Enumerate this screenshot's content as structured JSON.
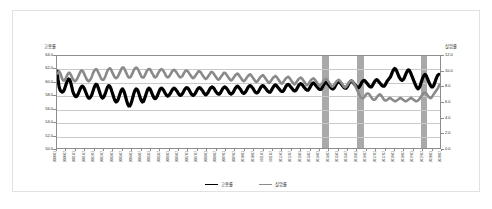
{
  "chart_data": {
    "type": "line",
    "title": "",
    "xlabel": "",
    "left_axis": {
      "title": "고용률",
      "unit": "%",
      "ylim": [
        50.0,
        64.0
      ],
      "ticks": [
        "64.0",
        "62.0",
        "60.0",
        "58.0",
        "56.0",
        "54.0",
        "52.0",
        "50.0"
      ]
    },
    "right_axis": {
      "title": "실업률",
      "unit": "%",
      "ylim": [
        0.0,
        12.0
      ],
      "ticks": [
        "12.0",
        "10.0",
        "8.0",
        "6.0",
        "4.0",
        "2.0",
        "0.0"
      ]
    },
    "grid": true,
    "legend_position": "bottom",
    "legend": [
      "고용률",
      "실업률"
    ],
    "x_tick_labels": [
      "2000.01",
      "2000.07",
      "2001.01",
      "2001.07",
      "2002.01",
      "2002.07",
      "2003.01",
      "2003.07",
      "2004.01",
      "2004.07",
      "2005.01",
      "2005.07",
      "2006.01",
      "2006.07",
      "2007.01",
      "2007.07",
      "2008.01",
      "2008.07",
      "2009.01",
      "2009.07",
      "2010.01",
      "2010.07",
      "2011.01",
      "2011.07",
      "2012.01",
      "2012.07",
      "2013.01",
      "2013.07",
      "2014.01",
      "2014.07",
      "2015.01",
      "2015.07",
      "2016.01",
      "2016.07",
      "2017.01",
      "2017.07",
      "2018.01",
      "2018.07",
      "2019.01",
      "2019.07",
      "2020.01",
      "2020.07"
    ],
    "shaded_bands": [
      {
        "label": "recession-band-1",
        "start_index": 250,
        "end_index": 256
      },
      {
        "label": "recession-band-2",
        "start_index": 283,
        "end_index": 289
      },
      {
        "label": "recession-band-3",
        "start_index": 343,
        "end_index": 349
      }
    ],
    "series": [
      {
        "name": "고용률",
        "axis": "left",
        "color": "#000000",
        "values": [
          61.9,
          60.4,
          59.3,
          58.8,
          58.6,
          58.5,
          58.6,
          58.9,
          59.4,
          59.9,
          60.3,
          60.5,
          60.4,
          60.0,
          59.3,
          58.6,
          58.2,
          57.9,
          57.8,
          57.9,
          58.2,
          58.6,
          59.0,
          59.3,
          59.4,
          59.3,
          59.0,
          58.6,
          58.2,
          57.8,
          57.6,
          57.6,
          57.8,
          58.1,
          58.6,
          59.1,
          59.5,
          59.7,
          59.6,
          59.2,
          58.7,
          58.2,
          57.8,
          57.6,
          57.7,
          58.0,
          58.4,
          58.9,
          59.3,
          59.5,
          59.4,
          59.1,
          58.6,
          58.1,
          57.6,
          57.2,
          57.0,
          57.1,
          57.4,
          57.9,
          58.4,
          58.8,
          59.0,
          58.8,
          58.4,
          57.8,
          57.2,
          56.7,
          56.4,
          56.4,
          56.7,
          57.2,
          57.8,
          58.4,
          58.8,
          59.0,
          58.9,
          58.6,
          58.1,
          57.6,
          57.2,
          57.0,
          57.1,
          57.5,
          58.0,
          58.5,
          58.9,
          59.1,
          59.0,
          58.7,
          58.3,
          57.9,
          57.6,
          57.5,
          57.6,
          57.9,
          58.3,
          58.7,
          59.0,
          59.1,
          59.0,
          58.8,
          58.5,
          58.2,
          58.0,
          57.9,
          58.0,
          58.2,
          58.5,
          58.8,
          59.0,
          59.1,
          59.0,
          58.8,
          58.6,
          58.3,
          58.1,
          58.0,
          58.1,
          58.3,
          58.6,
          58.9,
          59.1,
          59.2,
          59.1,
          58.9,
          58.6,
          58.3,
          58.1,
          58.0,
          58.1,
          58.3,
          58.6,
          58.9,
          59.1,
          59.2,
          59.1,
          58.9,
          58.7,
          58.4,
          58.2,
          58.1,
          58.2,
          58.4,
          58.7,
          59.0,
          59.2,
          59.3,
          59.2,
          59.0,
          58.7,
          58.5,
          58.3,
          58.2,
          58.2,
          58.4,
          58.7,
          59.0,
          59.2,
          59.3,
          59.2,
          59.0,
          58.8,
          58.5,
          58.3,
          58.2,
          58.3,
          58.5,
          58.8,
          59.1,
          59.3,
          59.4,
          59.3,
          59.1,
          58.9,
          58.6,
          58.4,
          58.3,
          58.4,
          58.6,
          58.9,
          59.2,
          59.4,
          59.5,
          59.4,
          59.2,
          59.0,
          58.7,
          58.5,
          58.4,
          58.4,
          58.6,
          58.9,
          59.2,
          59.4,
          59.5,
          59.4,
          59.2,
          59.0,
          58.8,
          58.6,
          58.5,
          58.5,
          58.7,
          59.0,
          59.3,
          59.5,
          59.6,
          59.5,
          59.3,
          59.1,
          58.9,
          58.7,
          58.6,
          58.6,
          58.8,
          59.1,
          59.4,
          59.6,
          59.7,
          59.6,
          59.4,
          59.2,
          59.0,
          58.8,
          58.7,
          58.7,
          58.9,
          59.2,
          59.5,
          59.7,
          59.8,
          59.7,
          59.5,
          59.3,
          59.1,
          58.9,
          58.8,
          58.8,
          59.0,
          59.3,
          59.6,
          59.8,
          59.9,
          59.8,
          59.6,
          59.4,
          59.2,
          59.0,
          58.9,
          58.9,
          59.1,
          59.4,
          59.7,
          59.9,
          60.0,
          59.9,
          59.7,
          59.5,
          59.3,
          59.1,
          59.0,
          59.0,
          59.2,
          59.5,
          59.8,
          60.0,
          60.1,
          60.0,
          59.8,
          59.6,
          59.4,
          59.2,
          59.1,
          59.1,
          59.3,
          59.6,
          59.9,
          60.1,
          60.2,
          60.1,
          59.9,
          59.7,
          59.5,
          59.3,
          59.2,
          59.2,
          59.4,
          59.7,
          60.0,
          60.2,
          60.3,
          60.2,
          60.0,
          59.8,
          59.6,
          59.4,
          59.3,
          59.3,
          59.5,
          59.8,
          60.1,
          60.3,
          60.4,
          60.3,
          60.1,
          59.9,
          59.7,
          59.5,
          59.4,
          59.4,
          59.6,
          59.9,
          60.2,
          60.4,
          60.6,
          60.8,
          61.2,
          61.6,
          61.9,
          62.1,
          62.0,
          61.7,
          61.3,
          60.9,
          60.6,
          60.4,
          60.3,
          60.4,
          60.6,
          61.0,
          61.4,
          61.7,
          61.9,
          61.8,
          61.5,
          61.1,
          60.7,
          60.3,
          59.9,
          59.5,
          59.2,
          59.0,
          59.1,
          59.4,
          59.9,
          60.4,
          60.8,
          61.1,
          61.2,
          61.0,
          60.6,
          60.2,
          59.8,
          59.5,
          59.3,
          59.3,
          59.5,
          59.9,
          60.4,
          60.8,
          61.1,
          61.2,
          61.1
        ]
      },
      {
        "name": "실업률",
        "axis": "right",
        "color": "#8a8a8a",
        "values": [
          9.6,
          9.8,
          10.0,
          9.8,
          9.4,
          9.0,
          8.8,
          8.8,
          9.0,
          9.3,
          9.6,
          9.8,
          9.8,
          9.6,
          9.3,
          9.0,
          8.8,
          8.7,
          8.8,
          9.0,
          9.3,
          9.6,
          9.9,
          10.1,
          10.1,
          9.9,
          9.6,
          9.3,
          9.0,
          8.8,
          8.7,
          8.8,
          9.0,
          9.3,
          9.7,
          10.0,
          10.2,
          10.3,
          10.2,
          9.9,
          9.6,
          9.3,
          9.0,
          8.9,
          8.9,
          9.1,
          9.4,
          9.8,
          10.1,
          10.3,
          10.4,
          10.3,
          10.0,
          9.7,
          9.4,
          9.2,
          9.1,
          9.2,
          9.4,
          9.7,
          10.0,
          10.3,
          10.5,
          10.5,
          10.3,
          10.0,
          9.7,
          9.4,
          9.2,
          9.2,
          9.3,
          9.6,
          9.9,
          10.2,
          10.4,
          10.5,
          10.4,
          10.2,
          9.9,
          9.6,
          9.3,
          9.2,
          9.2,
          9.4,
          9.7,
          10.0,
          10.2,
          10.3,
          10.3,
          10.1,
          9.8,
          9.6,
          9.3,
          9.2,
          9.3,
          9.5,
          9.8,
          10.0,
          10.2,
          10.3,
          10.2,
          10.0,
          9.8,
          9.5,
          9.3,
          9.2,
          9.3,
          9.5,
          9.7,
          10.0,
          10.1,
          10.2,
          10.1,
          9.9,
          9.7,
          9.5,
          9.3,
          9.2,
          9.3,
          9.4,
          9.7,
          9.9,
          10.1,
          10.1,
          10.0,
          9.8,
          9.6,
          9.4,
          9.2,
          9.1,
          9.2,
          9.4,
          9.6,
          9.8,
          10.0,
          10.0,
          9.9,
          9.7,
          9.5,
          9.3,
          9.1,
          9.0,
          9.1,
          9.3,
          9.5,
          9.7,
          9.9,
          9.9,
          9.8,
          9.6,
          9.4,
          9.2,
          9.0,
          8.9,
          9.0,
          9.2,
          9.4,
          9.6,
          9.8,
          9.8,
          9.7,
          9.5,
          9.3,
          9.1,
          8.9,
          8.8,
          8.9,
          9.1,
          9.3,
          9.5,
          9.6,
          9.7,
          9.6,
          9.4,
          9.2,
          9.0,
          8.8,
          8.7,
          8.8,
          9.0,
          9.2,
          9.4,
          9.5,
          9.6,
          9.5,
          9.3,
          9.1,
          8.9,
          8.7,
          8.6,
          8.7,
          8.9,
          9.1,
          9.3,
          9.4,
          9.5,
          9.4,
          9.2,
          9.0,
          8.8,
          8.6,
          8.5,
          8.6,
          8.8,
          9.0,
          9.2,
          9.3,
          9.4,
          9.3,
          9.1,
          8.9,
          8.7,
          8.5,
          8.4,
          8.5,
          8.7,
          8.9,
          9.1,
          9.2,
          9.3,
          9.2,
          9.0,
          8.8,
          8.6,
          8.4,
          8.3,
          8.4,
          8.6,
          8.8,
          9.0,
          9.1,
          9.2,
          9.1,
          8.9,
          8.7,
          8.5,
          8.3,
          8.2,
          8.3,
          8.5,
          8.7,
          8.9,
          9.0,
          9.1,
          9.0,
          8.8,
          8.6,
          8.4,
          8.2,
          8.1,
          8.2,
          8.4,
          8.6,
          8.8,
          8.9,
          9.0,
          8.9,
          8.7,
          8.5,
          8.3,
          8.1,
          8.0,
          8.1,
          8.3,
          8.5,
          8.7,
          8.8,
          8.9,
          8.8,
          8.6,
          8.4,
          8.2,
          8.0,
          7.9,
          8.0,
          8.2,
          8.4,
          8.6,
          8.7,
          8.8,
          8.7,
          8.5,
          8.3,
          8.0,
          7.7,
          7.4,
          7.1,
          6.8,
          6.6,
          6.5,
          6.5,
          6.6,
          6.8,
          7.0,
          7.1,
          7.1,
          7.0,
          6.8,
          6.6,
          6.4,
          6.3,
          6.3,
          6.4,
          6.6,
          6.8,
          6.9,
          7.0,
          6.9,
          6.7,
          6.5,
          6.3,
          6.2,
          6.2,
          6.3,
          6.4,
          6.5,
          6.5,
          6.4,
          6.3,
          6.2,
          6.1,
          6.1,
          6.2,
          6.3,
          6.4,
          6.5,
          6.5,
          6.4,
          6.3,
          6.2,
          6.1,
          6.1,
          6.2,
          6.3,
          6.4,
          6.5,
          6.5,
          6.4,
          6.3,
          6.2,
          6.1,
          6.1,
          6.2,
          6.3,
          6.5,
          6.7,
          6.9,
          7.1,
          7.2,
          7.2,
          7.1,
          6.9,
          6.7,
          6.6,
          6.5,
          6.6,
          6.8,
          7.0,
          7.2,
          7.4,
          7.6,
          7.8,
          8.1,
          8.4
        ]
      }
    ]
  }
}
